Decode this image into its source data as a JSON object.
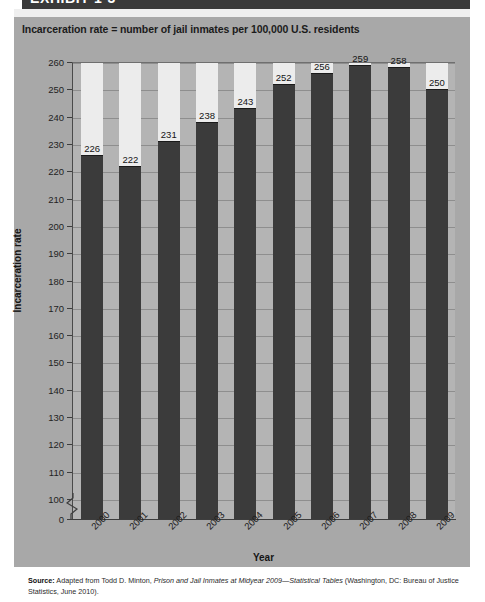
{
  "exhibit": {
    "banner_label": "EXHIBIT 1-3"
  },
  "chart_subtitle": "Incarceration rate = number of jail inmates per 100,000 U.S. residents",
  "axis": {
    "y_title": "Incarceration rate",
    "x_title": "Year",
    "y_ticks": [
      "260",
      "250",
      "240",
      "230",
      "220",
      "210",
      "200",
      "190",
      "180",
      "170",
      "160",
      "150",
      "140",
      "130",
      "120",
      "110",
      "100",
      "0"
    ]
  },
  "source": {
    "label": "Source:",
    "text_1": " Adapted from Todd D. Minton, ",
    "italic_1": "Prison and Jail Inmates at Midyear 2009—Statistical Tables",
    "text_2": " (Washington, DC: Bureau of Justice Statistics, June 2010)."
  },
  "colors": {
    "panel_bg": "#a8a8a8",
    "plot_bg": "#b4b4b4",
    "bar_fill": "#3b3b3b",
    "bar_backdrop": "#ececec",
    "gridline": "#8e8e8e",
    "banner": "#3a3a3a"
  },
  "chart_data": {
    "type": "bar",
    "title": "EXHIBIT 1-3",
    "subtitle": "Incarceration rate = number of jail inmates per 100,000 U.S. residents",
    "xlabel": "Year",
    "ylabel": "Incarceration rate",
    "categories": [
      "2000",
      "2001",
      "2002",
      "2003",
      "2004",
      "2005",
      "2006",
      "2007",
      "2008",
      "2009"
    ],
    "values": [
      226,
      222,
      231,
      238,
      243,
      252,
      256,
      259,
      258,
      250
    ],
    "data_labels": [
      "226",
      "222",
      "231",
      "238",
      "243",
      "252",
      "256",
      "259",
      "258",
      "250"
    ],
    "ylim": [
      100,
      260
    ],
    "ytick_step": 10,
    "axis_break": true,
    "axis_break_between": [
      0,
      100
    ],
    "grid": true,
    "legend": null,
    "annotations": []
  }
}
